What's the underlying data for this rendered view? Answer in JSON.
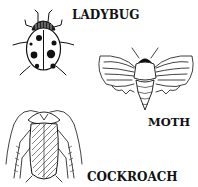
{
  "illustration": {
    "insects": [
      {
        "name": "ladybug",
        "label": "LADYBUG",
        "icon": "ladybug-icon"
      },
      {
        "name": "moth",
        "label": "MOTH",
        "icon": "moth-icon"
      },
      {
        "name": "cockroach",
        "label": "COCKROACH",
        "icon": "cockroach-icon"
      }
    ],
    "colors": {
      "ink": "#111111",
      "background": "#ffffff"
    }
  }
}
